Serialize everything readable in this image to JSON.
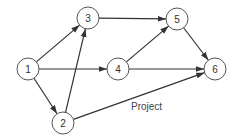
{
  "diagram": {
    "caption": "Project",
    "nodes": [
      {
        "id": "1",
        "label": "1",
        "x": 28,
        "y": 69
      },
      {
        "id": "2",
        "label": "2",
        "x": 63,
        "y": 123
      },
      {
        "id": "3",
        "label": "3",
        "x": 88,
        "y": 18
      },
      {
        "id": "4",
        "label": "4",
        "x": 118,
        "y": 69
      },
      {
        "id": "5",
        "label": "5",
        "x": 177,
        "y": 19
      },
      {
        "id": "6",
        "label": "6",
        "x": 215,
        "y": 69
      }
    ],
    "edges": [
      {
        "from": "1",
        "to": "3"
      },
      {
        "from": "1",
        "to": "4"
      },
      {
        "from": "1",
        "to": "2"
      },
      {
        "from": "2",
        "to": "3"
      },
      {
        "from": "2",
        "to": "6"
      },
      {
        "from": "3",
        "to": "5"
      },
      {
        "from": "4",
        "to": "5"
      },
      {
        "from": "4",
        "to": "6"
      },
      {
        "from": "5",
        "to": "6"
      }
    ],
    "node_radius": 11,
    "colors": {
      "stroke": "#555555",
      "edge": "#333333",
      "text": "#333333"
    }
  }
}
